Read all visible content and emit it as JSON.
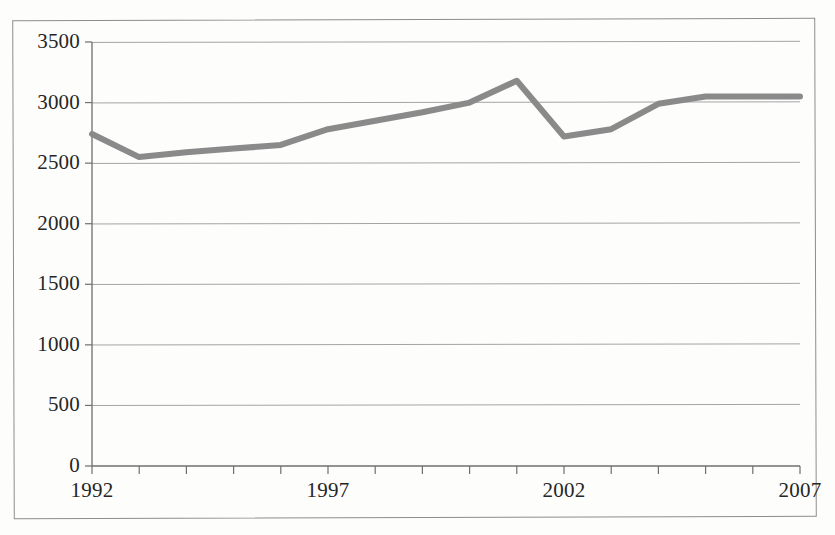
{
  "chart_data": {
    "type": "line",
    "title": "",
    "subtitle": "",
    "xlabel": "",
    "ylabel": "",
    "x": [
      1992,
      1993,
      1994,
      1995,
      1996,
      1997,
      1998,
      1999,
      2000,
      2001,
      2002,
      2003,
      2004,
      2005,
      2006,
      2007
    ],
    "values": [
      2740,
      2550,
      2590,
      2620,
      2650,
      2780,
      2850,
      2920,
      3000,
      3180,
      2720,
      2780,
      2990,
      3050,
      3050,
      3050
    ],
    "series": [
      {
        "name": "series-1",
        "values": [
          2740,
          2550,
          2590,
          2620,
          2650,
          2780,
          2850,
          2920,
          3000,
          3180,
          2720,
          2780,
          2990,
          3050,
          3050,
          3050
        ],
        "color": "#8a8a8a"
      }
    ],
    "xlim": [
      1992,
      2007
    ],
    "ylim": [
      0,
      3500
    ],
    "ytick_values": [
      0,
      500,
      1000,
      1500,
      2000,
      2500,
      3000,
      3500
    ],
    "ytick_labels": [
      "0",
      "500",
      "1000",
      "1500",
      "2000",
      "2500",
      "3000",
      "3500"
    ],
    "xtick_values": [
      1992,
      1993,
      1994,
      1995,
      1996,
      1997,
      1998,
      1999,
      2000,
      2001,
      2002,
      2003,
      2004,
      2005,
      2006,
      2007
    ],
    "xtick_labels_shown": [
      "1992",
      "1997",
      "2002",
      "2007"
    ],
    "xtick_label_positions": [
      1992,
      1997,
      2002,
      2007
    ],
    "grid": "horizontal",
    "legend": "none",
    "legend_position": "none",
    "annotations": [],
    "colors": {
      "line": "#8a8a8a",
      "gridline": "#9a9a9a",
      "axis": "#6f6f6f",
      "frame": "#8d8d8d",
      "text": "#262626",
      "background": "#fdfdfc"
    }
  }
}
